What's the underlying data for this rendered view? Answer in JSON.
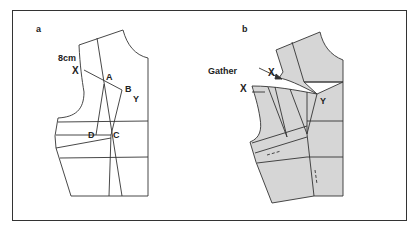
{
  "figure": {
    "panels": [
      {
        "id": "a",
        "label": "a",
        "annotations": {
          "measure": "8cm",
          "x": "X",
          "a": "A",
          "b": "B",
          "y": "Y",
          "c": "C",
          "d": "D"
        }
      },
      {
        "id": "b",
        "label": "b",
        "annotations": {
          "gather": "Gather",
          "x_upper": "X",
          "x_lower": "X",
          "y": "Y"
        }
      }
    ],
    "colors": {
      "line": "#333333",
      "fill_b": "#d6d6d6",
      "background": "#ffffff"
    }
  }
}
